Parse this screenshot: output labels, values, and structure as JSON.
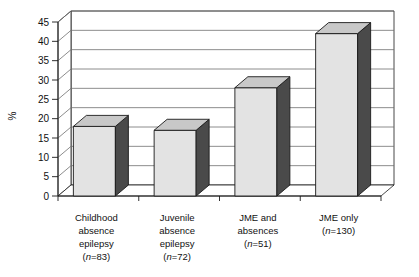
{
  "chart_data": {
    "type": "bar",
    "title": "",
    "xlabel": "",
    "ylabel": "%",
    "ylim": [
      0,
      45
    ],
    "ytick_step": 5,
    "yticks": [
      "0",
      "5",
      "10",
      "15",
      "20",
      "25",
      "30",
      "35",
      "40",
      "45"
    ],
    "grid": true,
    "legend": "none",
    "style": "3d-column",
    "categories": [
      "Childhood absence epilepsy (n=83)",
      "Juvenile absence epilepsy (n=72)",
      "JME and absences (n=51)",
      "JME only (n=130)"
    ],
    "values": [
      18,
      17,
      28,
      42
    ],
    "category_labels": [
      {
        "lines": [
          "Childhood",
          "absence",
          "epilepsy"
        ],
        "n_prefix": "n",
        "n_value": "=83"
      },
      {
        "lines": [
          "Juvenile",
          "absence",
          "epilepsy"
        ],
        "n_prefix": "n",
        "n_value": "=72"
      },
      {
        "lines": [
          "JME and",
          "absences"
        ],
        "n_prefix": "n",
        "n_value": "=51"
      },
      {
        "lines": [
          "JME only"
        ],
        "n_prefix": "n",
        "n_value": "=130"
      }
    ]
  },
  "colors": {
    "bar_front": "#e3e3e3",
    "bar_side": "#4a4a4a",
    "bar_top": "#c8c8c8",
    "outline": "#1a1a1a",
    "gridline": "#6f6f6f",
    "background": "#ffffff"
  },
  "axis": {
    "y_label": "%",
    "y_tick_0": "0",
    "y_tick_5": "5",
    "y_tick_10": "10",
    "y_tick_15": "15",
    "y_tick_20": "20",
    "y_tick_25": "25",
    "y_tick_30": "30",
    "y_tick_35": "35",
    "y_tick_40": "40",
    "y_tick_45": "45"
  },
  "bars": [
    {
      "value": 18,
      "label": "Childhood absence epilepsy"
    },
    {
      "value": 17,
      "label": "Juvenile absence epilepsy"
    },
    {
      "value": 28,
      "label": "JME and absences"
    },
    {
      "value": 42,
      "label": "JME only"
    }
  ]
}
